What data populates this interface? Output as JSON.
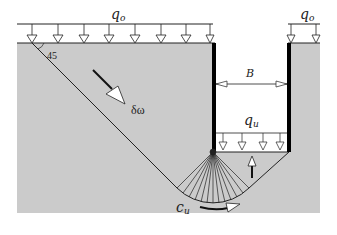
{
  "diagram": {
    "type": "geotechnical-failure-mechanism",
    "labels": {
      "surcharge_left": "q",
      "surcharge_left_sub": "o",
      "surcharge_right": "q",
      "surcharge_right_sub": "o",
      "width": "B",
      "base_pressure": "q",
      "base_pressure_sub": "u",
      "angle": "45",
      "displacement": "δω",
      "shear_strength": "c",
      "shear_strength_sub": "u"
    },
    "colors": {
      "soil": "#cbcbcb",
      "line": "#222222",
      "wall": "#000000",
      "background": "#ffffff"
    }
  }
}
